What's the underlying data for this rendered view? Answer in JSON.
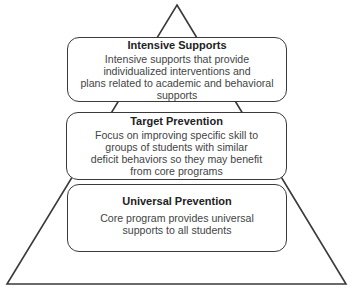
{
  "diagram": {
    "type": "pyramid",
    "stroke_color": "#3a3a3a",
    "background_color": "#ffffff",
    "tiers": [
      {
        "level": "top",
        "title": "Intensive Supports",
        "description_lines": [
          "Intensive supports that provide",
          "individualized interventions and",
          "plans related to academic and behavioral",
          "supports"
        ]
      },
      {
        "level": "middle",
        "title": "Target Prevention",
        "description_lines": [
          "Focus on improving specific skill to",
          "groups of students with similar",
          "deficit behaviors so they may benefit",
          "from core programs"
        ]
      },
      {
        "level": "bottom",
        "title": "Universal Prevention",
        "description_lines": [
          "Core program provides universal",
          "supports to all students"
        ]
      }
    ]
  }
}
